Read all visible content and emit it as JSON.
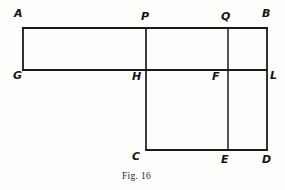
{
  "figure": {
    "caption": "Fig. 16",
    "caption_position": {
      "x": 122,
      "y": 171
    },
    "background_color": "#fdfdfb",
    "line_color": "#1a1a1a",
    "label_color": "#131313",
    "stroke_width": 1.8
  },
  "diagram_data": {
    "type": "geometry-line-figure",
    "description": "Composite rectilinear figure made of an upper horizontal strip AGLB and a lower rectangle HCDL, subdivided by vertical segments PH and QE.",
    "points": [
      {
        "id": "A",
        "label": "A",
        "x": 23,
        "y": 28,
        "label_x": 14,
        "label_y": 8
      },
      {
        "id": "P",
        "label": "P",
        "x": 146,
        "y": 28,
        "label_x": 141,
        "label_y": 11
      },
      {
        "id": "Q",
        "label": "Q",
        "x": 228,
        "y": 28,
        "label_x": 221,
        "label_y": 11
      },
      {
        "id": "B",
        "label": "B",
        "x": 267,
        "y": 28,
        "label_x": 262,
        "label_y": 8
      },
      {
        "id": "G",
        "label": "G",
        "x": 23,
        "y": 70,
        "label_x": 13,
        "label_y": 70
      },
      {
        "id": "H",
        "label": "H",
        "x": 146,
        "y": 70,
        "label_x": 132,
        "label_y": 71
      },
      {
        "id": "F",
        "label": "F",
        "x": 228,
        "y": 70,
        "label_x": 212,
        "label_y": 71
      },
      {
        "id": "L",
        "label": "L",
        "x": 267,
        "y": 70,
        "label_x": 270,
        "label_y": 70
      },
      {
        "id": "C",
        "label": "C",
        "x": 146,
        "y": 150,
        "label_x": 132,
        "label_y": 151
      },
      {
        "id": "E",
        "label": "E",
        "x": 228,
        "y": 150,
        "label_x": 221,
        "label_y": 154
      },
      {
        "id": "D",
        "label": "D",
        "x": 267,
        "y": 150,
        "label_x": 262,
        "label_y": 154
      }
    ],
    "segments": [
      {
        "name": "AB",
        "from": "A",
        "to": "B",
        "x1": 23,
        "y1": 28,
        "x2": 267,
        "y2": 28
      },
      {
        "name": "GL",
        "from": "G",
        "to": "L",
        "x1": 23,
        "y1": 70,
        "x2": 267,
        "y2": 70
      },
      {
        "name": "CD",
        "from": "C",
        "to": "D",
        "x1": 146,
        "y1": 150,
        "x2": 267,
        "y2": 150
      },
      {
        "name": "AG",
        "from": "A",
        "to": "G",
        "x1": 23,
        "y1": 28,
        "x2": 23,
        "y2": 70
      },
      {
        "name": "PC",
        "from": "P",
        "to": "C",
        "x1": 146,
        "y1": 28,
        "x2": 146,
        "y2": 150
      },
      {
        "name": "QE",
        "from": "Q",
        "to": "E",
        "x1": 228,
        "y1": 28,
        "x2": 228,
        "y2": 150
      },
      {
        "name": "BD",
        "from": "B",
        "to": "D",
        "x1": 267,
        "y1": 28,
        "x2": 267,
        "y2": 150
      }
    ]
  }
}
